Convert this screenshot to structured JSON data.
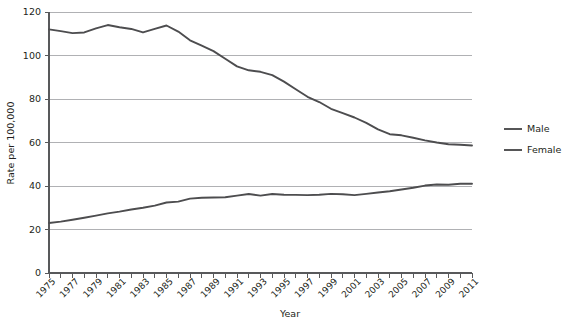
{
  "chart_data": {
    "type": "line",
    "title": "",
    "xlabel": "Year",
    "ylabel": "Rate per 100,000",
    "ylim": [
      0,
      120
    ],
    "ytick_step": 20,
    "yticks": [
      0,
      20,
      40,
      60,
      80,
      100,
      120
    ],
    "grid": true,
    "legend_position": "right",
    "x": [
      1975,
      1976,
      1977,
      1978,
      1979,
      1980,
      1981,
      1982,
      1983,
      1984,
      1985,
      1986,
      1987,
      1988,
      1989,
      1990,
      1991,
      1992,
      1993,
      1994,
      1995,
      1996,
      1997,
      1998,
      1999,
      2000,
      2001,
      2002,
      2003,
      2004,
      2005,
      2006,
      2007,
      2008,
      2009,
      2010,
      2011
    ],
    "xtick_labels": [
      "1975",
      "1977",
      "1979",
      "1981",
      "1983",
      "1985",
      "1987",
      "1989",
      "1991",
      "1993",
      "1995",
      "1997",
      "1999",
      "2001",
      "2003",
      "2005",
      "2007",
      "2009",
      "2011"
    ],
    "xlim": [
      1975,
      2011
    ],
    "series": [
      {
        "name": "Male",
        "color": "#4d4d4f",
        "values": [
          112.0,
          111.2,
          110.3,
          110.6,
          112.5,
          114.0,
          113.0,
          112.2,
          110.6,
          112.2,
          113.8,
          111.0,
          107.0,
          104.5,
          102.0,
          98.5,
          95.0,
          93.2,
          92.5,
          91.0,
          88.0,
          84.5,
          81.0,
          78.6,
          75.5,
          73.5,
          71.5,
          69.0,
          66.0,
          63.8,
          63.3,
          62.2,
          61.0,
          60.0,
          59.2,
          59.0,
          58.6
        ]
      },
      {
        "name": "Female",
        "color": "#4d4d4f",
        "values": [
          23.0,
          23.6,
          24.5,
          25.4,
          26.4,
          27.4,
          28.2,
          29.2,
          30.0,
          31.0,
          32.4,
          32.8,
          34.2,
          34.6,
          34.7,
          34.8,
          35.6,
          36.3,
          35.6,
          36.3,
          36.0,
          35.9,
          35.8,
          36.0,
          36.4,
          36.2,
          35.8,
          36.4,
          37.0,
          37.6,
          38.4,
          39.2,
          40.2,
          40.7,
          40.6,
          41.0,
          41.0
        ]
      }
    ],
    "legend": [
      {
        "label": "Male"
      },
      {
        "label": "Female"
      }
    ]
  }
}
